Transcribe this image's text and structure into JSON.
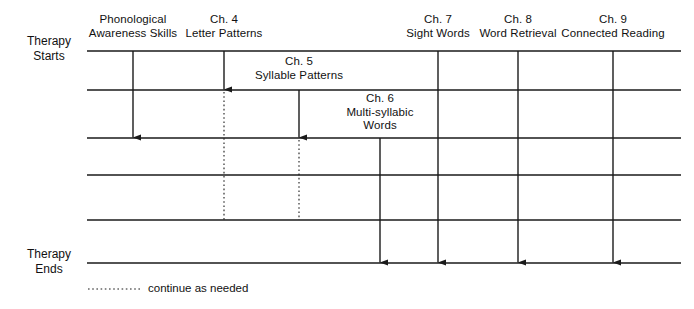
{
  "figure": {
    "type": "timeline-sequence-diagram",
    "background": "#ffffff",
    "line_color": "#1a1a1a"
  },
  "left_labels": {
    "start": "Therapy\nStarts",
    "end": "Therapy\nEnds"
  },
  "columns": [
    {
      "id": "phonological-awareness-skills",
      "chapter": "",
      "title": "Phonological\nAwareness Skills",
      "label_x": 133,
      "label_y": 13,
      "label_width": 118,
      "x": 133,
      "solid_from": 51,
      "solid_to": 138,
      "arrowhead": true,
      "dotted_from": null,
      "dotted_to": null
    },
    {
      "id": "ch-4-letter-patterns",
      "chapter": "Ch. 4",
      "title": "Ch. 4\nLetter Patterns",
      "label_x": 224,
      "label_y": 13,
      "label_width": 104,
      "x": 224,
      "solid_from": 51,
      "solid_to": 90,
      "arrowhead": true,
      "dotted_from": 92,
      "dotted_to": 220
    },
    {
      "id": "ch-5-syllable-patterns",
      "chapter": "Ch. 5",
      "title": "Ch. 5\nSyllable Patterns",
      "label_x": 299,
      "label_y": 55,
      "label_width": 116,
      "x": 299,
      "solid_from": 90,
      "solid_to": 138,
      "arrowhead": true,
      "dotted_from": 140,
      "dotted_to": 220
    },
    {
      "id": "ch-6-multi-syllabic-words",
      "chapter": "Ch. 6",
      "title": "Ch. 6\nMulti-syllabic\nWords",
      "label_x": 380,
      "label_y": 92,
      "label_width": 100,
      "x": 380,
      "solid_from": 138,
      "solid_to": 263,
      "arrowhead": true,
      "dotted_from": null,
      "dotted_to": null
    },
    {
      "id": "ch-7-sight-words",
      "chapter": "Ch. 7",
      "title": "Ch. 7\nSight Words",
      "label_x": 438,
      "label_y": 13,
      "label_width": 92,
      "x": 438,
      "solid_from": 51,
      "solid_to": 263,
      "arrowhead": true,
      "dotted_from": null,
      "dotted_to": null
    },
    {
      "id": "ch-8-word-retrieval",
      "chapter": "Ch. 8",
      "title": "Ch. 8\nWord Retrieval",
      "label_x": 518,
      "label_y": 13,
      "label_width": 104,
      "x": 518,
      "solid_from": 51,
      "solid_to": 263,
      "arrowhead": true,
      "dotted_from": null,
      "dotted_to": null
    },
    {
      "id": "ch-9-connected-reading",
      "chapter": "Ch. 9",
      "title": "Ch. 9\nConnected Reading",
      "label_x": 613,
      "label_y": 13,
      "label_width": 136,
      "x": 613,
      "solid_from": 51,
      "solid_to": 263,
      "arrowhead": true,
      "dotted_from": null,
      "dotted_to": null
    }
  ],
  "horizontal_lines": {
    "x_start": 87,
    "x_end": 681,
    "y_values": [
      51,
      90,
      138,
      175,
      220,
      263
    ]
  },
  "legend": {
    "text": "continue as needed",
    "dash_x_start": 88,
    "dash_x_end": 140,
    "y": 289
  }
}
